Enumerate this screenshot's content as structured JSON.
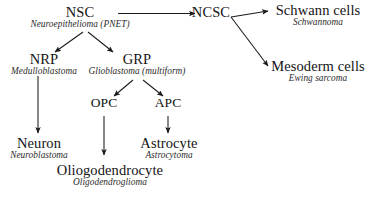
{
  "diagram": {
    "type": "flowchart",
    "stroke_color": "#1a1a1a",
    "text_color": "#141414",
    "background": "#ffffff",
    "nodes": [
      {
        "id": "nsc",
        "cell": "NSC",
        "tumor": "Neuroepithelioma (PNET)"
      },
      {
        "id": "ncsc",
        "cell": "NCSC",
        "tumor": ""
      },
      {
        "id": "schwann",
        "cell": "Schwann cells",
        "tumor": "Schwannoma"
      },
      {
        "id": "mesoderm",
        "cell": "Mesoderm cells",
        "tumor": "Ewing sarcoma"
      },
      {
        "id": "nrp",
        "cell": "NRP",
        "tumor": "Medulloblastoma"
      },
      {
        "id": "grp",
        "cell": "GRP",
        "tumor": "Glioblastoma (multiform)"
      },
      {
        "id": "opc",
        "cell": "OPC",
        "tumor": ""
      },
      {
        "id": "apc",
        "cell": "APC",
        "tumor": ""
      },
      {
        "id": "neuron",
        "cell": "Neuron",
        "tumor": "Neuroblastoma"
      },
      {
        "id": "astrocyte",
        "cell": "Astrocyte",
        "tumor": "Astrocytoma"
      },
      {
        "id": "oligodendrocyte",
        "cell": "Oliogodendrocyte",
        "tumor": "Oligodendroglioma"
      }
    ],
    "edges": [
      {
        "from": "nsc",
        "to": "ncsc"
      },
      {
        "from": "nsc",
        "to": "nrp"
      },
      {
        "from": "nsc",
        "to": "grp"
      },
      {
        "from": "ncsc",
        "to": "schwann"
      },
      {
        "from": "ncsc",
        "to": "mesoderm"
      },
      {
        "from": "nrp",
        "to": "neuron"
      },
      {
        "from": "grp",
        "to": "opc"
      },
      {
        "from": "grp",
        "to": "apc"
      },
      {
        "from": "opc",
        "to": "oligodendrocyte"
      },
      {
        "from": "apc",
        "to": "astrocyte"
      }
    ]
  }
}
